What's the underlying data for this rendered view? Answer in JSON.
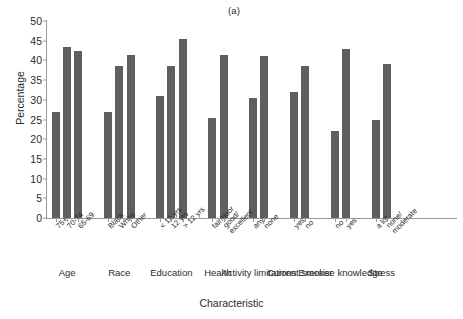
{
  "figure": {
    "panel_label": "(a)",
    "xlabel": "Characteristic",
    "ylabel": "Percentage"
  },
  "chart_data": {
    "type": "bar",
    "title": "(a)",
    "xlabel": "Characteristic",
    "ylabel": "Percentage",
    "ylim": [
      0,
      50
    ],
    "yticks": [
      0,
      5,
      10,
      15,
      20,
      25,
      30,
      35,
      40,
      45,
      50
    ],
    "grid": false,
    "legend": null,
    "bar_color": "#5f5f5f",
    "significance_marker": "*",
    "groups": [
      {
        "name": "Age",
        "categories": [
          "75+",
          "70-74",
          "65-69"
        ],
        "values": [
          27,
          43.5,
          42.5
        ],
        "significant": [
          false,
          true,
          true
        ]
      },
      {
        "name": "Race",
        "categories": [
          "Black",
          "White",
          "Other"
        ],
        "values": [
          27,
          38.5,
          41.5
        ],
        "significant": [
          false,
          false,
          false
        ]
      },
      {
        "name": "Education",
        "categories": [
          "< 12 yrs",
          "12 yrs",
          "> 12 yrs"
        ],
        "values": [
          31,
          38.5,
          45.5
        ],
        "significant": [
          false,
          false,
          true
        ]
      },
      {
        "name": "Health",
        "categories": [
          "fair/poor",
          "good/ excellent"
        ],
        "values": [
          25.5,
          41.5
        ],
        "significant": [
          false,
          true
        ]
      },
      {
        "name": "Activity limitations",
        "categories": [
          "any",
          "none"
        ],
        "values": [
          30.5,
          41
        ],
        "significant": [
          false,
          false
        ]
      },
      {
        "name": "Current smoker",
        "categories": [
          "yes",
          "no"
        ],
        "values": [
          32,
          38.5
        ],
        "significant": [
          false,
          false
        ]
      },
      {
        "name": "Exercise knowledge",
        "categories": [
          "no",
          "yes"
        ],
        "values": [
          22,
          43
        ],
        "significant": [
          false,
          true
        ]
      },
      {
        "name": "Stress",
        "categories": [
          "a lot",
          "none/ moderate"
        ],
        "values": [
          25,
          39
        ],
        "significant": [
          false,
          true
        ]
      }
    ]
  }
}
